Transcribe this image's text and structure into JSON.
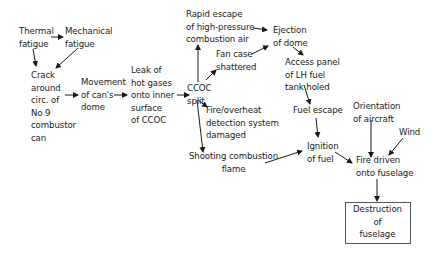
{
  "diagram": {
    "type": "cause-effect flow diagram",
    "nodes": {
      "thermal_fatigue": "Thermal\nfatigue",
      "mechanical_fatigue": "Mechanical\nfatigue",
      "crack": "Crack\naround\ncirc. of\nNo 9\ncombustor\ncan",
      "movement": "Movement\nof can's\ndome",
      "leak": "Leak of\nhot gases\nonto inner\nsurface\nof CCOC",
      "ccoc_split": "CCOC\nsplit",
      "rapid_escape": "Rapid escape\nof high-pressure\ncombustion air",
      "fan_case": "Fan case\nshattered",
      "fire_detection": "Fire/overheat\ndetection system\ndamaged",
      "shooting_flame": "Shooting combustion\nflame",
      "ejection_dome": "Ejection\nof dome",
      "access_panel": "Access panel\nof LH fuel\ntank holed",
      "fuel_escape": "Fuel escape",
      "ignition": "Ignition\nof fuel",
      "orientation": "Orientation\nof aircraft",
      "wind": "Wind",
      "fire_driven": "Fire driven\nonto fuselage",
      "destruction": "Destruction\nof\nfuselage"
    },
    "edges": [
      [
        "thermal_fatigue",
        "mechanical_fatigue"
      ],
      [
        "thermal_fatigue",
        "crack"
      ],
      [
        "mechanical_fatigue",
        "crack"
      ],
      [
        "crack",
        "movement"
      ],
      [
        "movement",
        "leak"
      ],
      [
        "leak",
        "ccoc_split"
      ],
      [
        "ccoc_split",
        "rapid_escape"
      ],
      [
        "ccoc_split",
        "fan_case"
      ],
      [
        "ccoc_split",
        "fire_detection"
      ],
      [
        "ccoc_split",
        "shooting_flame"
      ],
      [
        "rapid_escape",
        "ejection_dome"
      ],
      [
        "fan_case",
        "ejection_dome"
      ],
      [
        "ejection_dome",
        "access_panel"
      ],
      [
        "access_panel",
        "fuel_escape"
      ],
      [
        "fuel_escape",
        "ignition"
      ],
      [
        "shooting_flame",
        "ignition"
      ],
      [
        "ignition",
        "fire_driven"
      ],
      [
        "orientation",
        "fire_driven"
      ],
      [
        "wind",
        "fire_driven"
      ],
      [
        "fire_driven",
        "destruction"
      ]
    ],
    "colors": {
      "line": "#1a1a1a",
      "box_border": "#555555",
      "background": "#ffffff"
    }
  }
}
